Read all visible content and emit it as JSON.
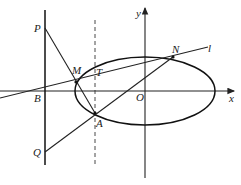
{
  "diagram": {
    "type": "geometry-figure",
    "labels": {
      "P": "P",
      "M": "M",
      "T": "T",
      "N": "N",
      "l": "l",
      "y": "y",
      "x": "x",
      "B": "B",
      "O": "O",
      "A": "A",
      "Q": "Q"
    },
    "points": {
      "P": [
        45,
        28
      ],
      "Q": [
        45,
        152
      ],
      "B": [
        45,
        90
      ],
      "M": [
        76,
        82
      ],
      "N": [
        173,
        57
      ],
      "A": [
        95,
        113
      ],
      "T": [
        95,
        77
      ],
      "O": [
        145,
        91
      ]
    },
    "ellipse": {
      "cx": 145,
      "cy": 91,
      "rx": 70,
      "ry": 34
    },
    "colors": {
      "stroke": "#222222",
      "background": "#ffffff"
    }
  }
}
